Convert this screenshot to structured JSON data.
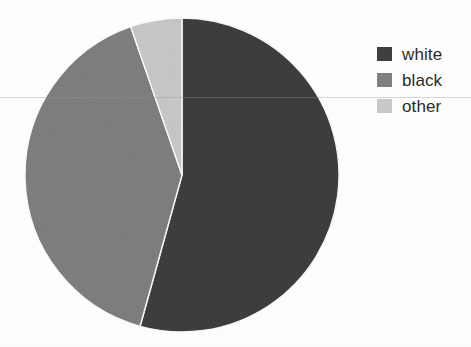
{
  "figure": {
    "background_color": "#fdfdfc",
    "width": 471,
    "height": 347
  },
  "legend": {
    "position": "right",
    "items": [
      {
        "label": "white",
        "color": "#3f3f3f",
        "swatch_name": "legend-swatch-white"
      },
      {
        "label": "black",
        "color": "#808080",
        "swatch_name": "legend-swatch-black"
      },
      {
        "label": "other",
        "color": "#c9c9c9",
        "swatch_name": "legend-swatch-other"
      }
    ]
  },
  "chart_data": {
    "type": "pie",
    "title": "",
    "subtitle": "",
    "xlabel": "",
    "ylabel": "",
    "categories": [
      "white",
      "black",
      "other"
    ],
    "values": [
      54.3,
      40.4,
      5.3
    ],
    "value_unit": "percent",
    "colors": [
      "#3f3f3f",
      "#808080",
      "#c9c9c9"
    ],
    "start_angle_deg": 90,
    "direction": "clockwise",
    "slice_angles_deg": [
      195.4,
      145.4,
      19.2
    ],
    "labels_shown_on_slices": false,
    "legend": true,
    "legend_position": "right",
    "grid": false,
    "annotations": []
  },
  "geometry": {
    "center_x": 158,
    "center_y": 158,
    "radius": 157
  }
}
